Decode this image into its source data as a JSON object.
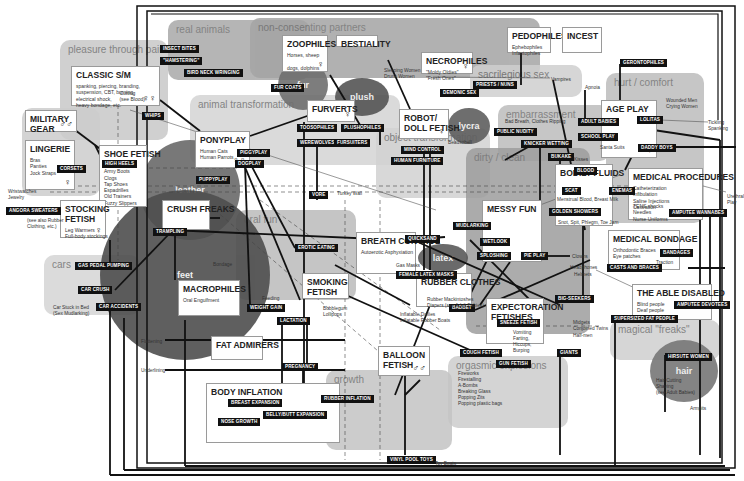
{
  "zones": [
    {
      "id": "real-animals",
      "label": "real animals",
      "x": 168,
      "y": 20,
      "w": 142,
      "h": 60,
      "color": "#a9a9a9"
    },
    {
      "id": "non-consenting",
      "label": "non-consenting partners",
      "x": 250,
      "y": 18,
      "w": 290,
      "h": 60,
      "color": "#a4a4a4"
    },
    {
      "id": "pleasure-pain",
      "label": "pleasure through pain",
      "x": 60,
      "y": 40,
      "w": 108,
      "h": 100,
      "color": "#c8c8c8"
    },
    {
      "id": "sacrilegious",
      "label": "sacrilegious sex",
      "x": 470,
      "y": 65,
      "w": 112,
      "h": 32,
      "color": "#cfcfcf"
    },
    {
      "id": "hurt-comfort",
      "label": "hurt / comfort",
      "x": 606,
      "y": 73,
      "w": 98,
      "h": 150,
      "color": "#bdbdbd"
    },
    {
      "id": "animal-transformation",
      "label": "animal transformation",
      "x": 190,
      "y": 95,
      "w": 210,
      "h": 70,
      "color": "#d4d4d4"
    },
    {
      "id": "embarrassment",
      "label": "embarrassment",
      "x": 498,
      "y": 105,
      "w": 112,
      "h": 56,
      "color": "#bdbdbd"
    },
    {
      "id": "clothing",
      "label": "clothing",
      "x": 22,
      "y": 108,
      "w": 78,
      "h": 88,
      "color": "#cdcdcd"
    },
    {
      "id": "object-transformation",
      "label": "object transformation",
      "x": 376,
      "y": 128,
      "w": 114,
      "h": 70,
      "color": "#d2d2d2"
    },
    {
      "id": "dirty-clean",
      "label": "dirty / clean",
      "x": 466,
      "y": 148,
      "w": 124,
      "h": 186,
      "color": "#9d9d9d"
    },
    {
      "id": "oral-fun",
      "label": "oral fun",
      "x": 236,
      "y": 210,
      "w": 120,
      "h": 90,
      "color": "#bbbbbb"
    },
    {
      "id": "cars",
      "label": "cars",
      "x": 44,
      "y": 255,
      "w": 96,
      "h": 60,
      "color": "#d5d5d5"
    },
    {
      "id": "magical-freaks",
      "label": "magical \"freaks\"",
      "x": 610,
      "y": 320,
      "w": 110,
      "h": 40,
      "color": "#cfcfcf"
    },
    {
      "id": "orgasmic-explosions",
      "label": "orgasmic explosions",
      "x": 448,
      "y": 356,
      "w": 120,
      "h": 72,
      "color": "#cdcdcd"
    },
    {
      "id": "growth",
      "label": "growth",
      "x": 326,
      "y": 370,
      "w": 126,
      "h": 80,
      "color": "#c4c4c4"
    }
  ],
  "blobs": [
    {
      "id": "fur",
      "label": "fur",
      "x": 278,
      "y": 60,
      "w": 50,
      "h": 50,
      "color": "#6f6f6f"
    },
    {
      "id": "plush",
      "label": "plush",
      "x": 335,
      "y": 78,
      "w": 54,
      "h": 38,
      "color": "#555555"
    },
    {
      "id": "lycra",
      "label": "lycra",
      "x": 448,
      "y": 108,
      "w": 42,
      "h": 36,
      "color": "#5f5f5f"
    },
    {
      "id": "leather",
      "label": "leather",
      "x": 140,
      "y": 140,
      "w": 100,
      "h": 100,
      "color": "#6a6a6a"
    },
    {
      "id": "feet",
      "label": "feet",
      "x": 100,
      "y": 190,
      "w": 170,
      "h": 170,
      "color": "#4e4e4e"
    },
    {
      "id": "latex",
      "label": "latex",
      "x": 418,
      "y": 244,
      "w": 50,
      "h": 28,
      "color": "#5a5a5a"
    },
    {
      "id": "hair",
      "label": "hair",
      "x": 650,
      "y": 340,
      "w": 68,
      "h": 62,
      "color": "#777777"
    }
  ],
  "boxes": [
    {
      "id": "classic-sm",
      "title": "CLASSIC S/M",
      "x": 71,
      "y": 66,
      "w": 89,
      "h": 40,
      "sub": "spanking, piercing, branding,\nsuspension, CBT, burning,\nelectrical shock,\nheavy bondage, etc.",
      "note": "Cutting\n(see Blood)",
      "symbol": "♀♀"
    },
    {
      "id": "zoophiles",
      "title": "ZOOPHILES",
      "x": 282,
      "y": 35,
      "w": 46,
      "h": 37,
      "sub": "Horses, sheep\n\ndogs, dolphins",
      "symbol": "♀"
    },
    {
      "id": "bestiality",
      "title": "BESTIALITY",
      "x": 336,
      "y": 35,
      "w": 42,
      "h": 12,
      "sub": ""
    },
    {
      "id": "necrophiles",
      "title": "NECROPHILES",
      "x": 421,
      "y": 52,
      "w": 52,
      "h": 22,
      "sub": "\"Moldy Oldies\"\n\"Fresh Ones\"",
      "symbol": "♀"
    },
    {
      "id": "pedophiles",
      "title": "PEDOPHILES",
      "x": 507,
      "y": 27,
      "w": 44,
      "h": 26,
      "sub": "Ephebophiles\nInfantophiles"
    },
    {
      "id": "incest",
      "title": "INCEST",
      "x": 562,
      "y": 27,
      "w": 40,
      "h": 26,
      "sub": ""
    },
    {
      "id": "military-gear",
      "title": "MILITARY\nGEAR",
      "x": 25,
      "y": 110,
      "w": 52,
      "h": 22,
      "sub": "",
      "symbol": "♂♂"
    },
    {
      "id": "lingerie",
      "title": "LINGERIE",
      "x": 25,
      "y": 140,
      "w": 50,
      "h": 50,
      "sub": "Bras\nPanties\nJock Straps",
      "symbol": "♀"
    },
    {
      "id": "shoe-fetish",
      "title": "SHOE FETISH",
      "x": 99,
      "y": 145,
      "w": 48,
      "h": 62,
      "sub": "Doc Martens\nArmy Boots\nClogs\nTap Shoes\nEspadrilles\nOld Trainers\nFuzzy Slippers"
    },
    {
      "id": "ponyplay",
      "title": "PONYPLAY",
      "x": 195,
      "y": 131,
      "w": 55,
      "h": 37,
      "sub": "Human Cats\nHuman Parrots",
      "symbol": "♀♀"
    },
    {
      "id": "furverts",
      "title": "FURVERTS",
      "x": 307,
      "y": 100,
      "w": 48,
      "h": 22,
      "sub": "",
      "symbol": "♀"
    },
    {
      "id": "robot-doll",
      "title": "ROBOT/\nDOLL FETISH",
      "x": 399,
      "y": 109,
      "w": 50,
      "h": 30,
      "sub": "",
      "symbol": "♀"
    },
    {
      "id": "age-play",
      "title": "AGE PLAY",
      "x": 601,
      "y": 100,
      "w": 56,
      "h": 58,
      "sub": "",
      "symbol": "♀"
    },
    {
      "id": "stocking-fetish",
      "title": "STOCKING\nFETISH",
      "x": 60,
      "y": 200,
      "w": 46,
      "h": 38,
      "sub": "Leg Warmers\nFull-body stockings",
      "symbol": "♀"
    },
    {
      "id": "crush-freaks",
      "title": "CRUSH FREAKS",
      "x": 162,
      "y": 200,
      "w": 48,
      "h": 30,
      "sub": ""
    },
    {
      "id": "bodily-fluids",
      "title": "BODILY FLUIDS",
      "x": 555,
      "y": 164,
      "w": 58,
      "h": 62,
      "sub": "",
      "symbol": ""
    },
    {
      "id": "medical-procedures",
      "title": "MEDICAL PROCEDURES",
      "x": 628,
      "y": 168,
      "w": 75,
      "h": 52,
      "sub": "Catheterization\nInfibulation\nSaline Injections\nCastration",
      "sub2": "TENS shocks\nNeedles\nNurse Uniforms"
    },
    {
      "id": "messy-fun",
      "title": "MESSY FUN",
      "x": 482,
      "y": 200,
      "w": 60,
      "h": 62,
      "sub": ""
    },
    {
      "id": "breath-control",
      "title": "BREATH CONTROL",
      "x": 356,
      "y": 232,
      "w": 60,
      "h": 42,
      "sub": "Autoerotic Asphyxiation"
    },
    {
      "id": "medical-bondage",
      "title": "MEDICAL BONDAGE",
      "x": 608,
      "y": 230,
      "w": 72,
      "h": 40,
      "sub": "Orthodontic Braces\nEye patches"
    },
    {
      "id": "rubber-clothes",
      "title": "RUBBER CLOTHES",
      "x": 416,
      "y": 273,
      "w": 56,
      "h": 34,
      "sub": ""
    },
    {
      "id": "smoking-fetish",
      "title": "SMOKING\nFETISH",
      "x": 302,
      "y": 273,
      "w": 47,
      "h": 26,
      "sub": ""
    },
    {
      "id": "macrophiles",
      "title": "MACROPHILES",
      "x": 178,
      "y": 280,
      "w": 62,
      "h": 36,
      "sub": "Oral Engulfment"
    },
    {
      "id": "able-disabled",
      "title": "THE ABLE DISABLED",
      "x": 632,
      "y": 284,
      "w": 80,
      "h": 36,
      "sub": "Blind people\nDeaf people\nParaplegics"
    },
    {
      "id": "expectoration",
      "title": "EXPECTORATION\nFETISHES",
      "x": 486,
      "y": 298,
      "w": 58,
      "h": 46,
      "sub": ""
    },
    {
      "id": "fat-admirers",
      "title": "FAT ADMIRERS",
      "x": 211,
      "y": 336,
      "w": 52,
      "h": 24,
      "sub": ""
    },
    {
      "id": "balloon-fetish",
      "title": "BALLOON\nFETISH",
      "x": 378,
      "y": 346,
      "w": 52,
      "h": 30,
      "sub": "",
      "symbol": "♂♂"
    },
    {
      "id": "body-inflation",
      "title": "BODY INFLATION",
      "x": 206,
      "y": 383,
      "w": 134,
      "h": 60,
      "sub": ""
    }
  ],
  "tags": [
    {
      "label": "INSECT BITES",
      "x": 160,
      "y": 45
    },
    {
      "label": "\"HAMSTERING\"",
      "x": 160,
      "y": 57
    },
    {
      "label": "BIRD NECK WRINGING",
      "x": 184,
      "y": 69
    },
    {
      "label": "FUR COATS",
      "x": 271,
      "y": 84
    },
    {
      "label": "WHIPS",
      "x": 142,
      "y": 112
    },
    {
      "label": "PRIESTS / NUNS",
      "x": 473,
      "y": 81
    },
    {
      "label": "DEMONIC SEX",
      "x": 440,
      "y": 89
    },
    {
      "label": "GERONTOPHILES",
      "x": 620,
      "y": 59
    },
    {
      "label": "ADULT BABIES",
      "x": 578,
      "y": 118
    },
    {
      "label": "LOLITAS",
      "x": 637,
      "y": 116
    },
    {
      "label": "SCHOOL PLAY",
      "x": 578,
      "y": 133
    },
    {
      "label": "DADDY BOYS",
      "x": 638,
      "y": 144
    },
    {
      "label": "PUBLIC NUDITY",
      "x": 494,
      "y": 128
    },
    {
      "label": "KNICKER WETTING",
      "x": 521,
      "y": 140
    },
    {
      "label": "BUKAKE",
      "x": 548,
      "y": 153
    },
    {
      "label": "BLOOD",
      "x": 574,
      "y": 167
    },
    {
      "label": "SCAT",
      "x": 562,
      "y": 187
    },
    {
      "label": "ENEMAS",
      "x": 609,
      "y": 187
    },
    {
      "label": "GOLDEN SHOWERS",
      "x": 549,
      "y": 208
    },
    {
      "label": "AMPUTEE WANNABES",
      "x": 669,
      "y": 209
    },
    {
      "label": "TOOSOPHILES",
      "x": 297,
      "y": 124
    },
    {
      "label": "PLUSHOPHILES",
      "x": 341,
      "y": 124
    },
    {
      "label": "WEREWOLVES",
      "x": 297,
      "y": 139
    },
    {
      "label": "FURSUITERS",
      "x": 334,
      "y": 139
    },
    {
      "label": "MIND CONTROL",
      "x": 401,
      "y": 146
    },
    {
      "label": "HUMAN FURNITURE",
      "x": 391,
      "y": 157
    },
    {
      "label": "HIGH HEELS",
      "x": 102,
      "y": 160
    },
    {
      "label": "PIGGYPLAY",
      "x": 237,
      "y": 149
    },
    {
      "label": "DOGPLAY",
      "x": 235,
      "y": 160
    },
    {
      "label": "PUPPYPLAY",
      "x": 196,
      "y": 176
    },
    {
      "label": "CORSETS",
      "x": 57,
      "y": 165
    },
    {
      "label": "ANGORA SWEATERS",
      "x": 6,
      "y": 207
    },
    {
      "label": "VORE",
      "x": 309,
      "y": 191
    },
    {
      "label": "MUDLARKING",
      "x": 453,
      "y": 222
    },
    {
      "label": "QUICKSAND",
      "x": 405,
      "y": 235
    },
    {
      "label": "WETLOOK",
      "x": 480,
      "y": 238
    },
    {
      "label": "SPLOSHING",
      "x": 477,
      "y": 252
    },
    {
      "label": "PIE PLAY",
      "x": 521,
      "y": 252
    },
    {
      "label": "BANDAGES",
      "x": 660,
      "y": 249
    },
    {
      "label": "CASTS AND BRACES",
      "x": 607,
      "y": 264
    },
    {
      "label": "TRAMPLING",
      "x": 153,
      "y": 228
    },
    {
      "label": "EROTIC EATING",
      "x": 295,
      "y": 244
    },
    {
      "label": "FEMALE LATEX MASKS",
      "x": 396,
      "y": 271
    },
    {
      "label": "GAS PEDAL PUMPING",
      "x": 75,
      "y": 262
    },
    {
      "label": "CAR CRUSH",
      "x": 78,
      "y": 286
    },
    {
      "label": "CAR ACCIDENTS",
      "x": 96,
      "y": 303
    },
    {
      "label": "WEIGHT GAIN",
      "x": 247,
      "y": 304
    },
    {
      "label": "LACTATION",
      "x": 277,
      "y": 317
    },
    {
      "label": "BIG-SEEKERS",
      "x": 555,
      "y": 295
    },
    {
      "label": "BADBET",
      "x": 449,
      "y": 304
    },
    {
      "label": "AMPUTEE DEVOTEES",
      "x": 674,
      "y": 301
    },
    {
      "label": "SUPERSIZED FAT PEOPLE",
      "x": 611,
      "y": 315
    },
    {
      "label": "SNEEZE FETISH",
      "x": 497,
      "y": 319
    },
    {
      "label": "COUGH FETISH",
      "x": 460,
      "y": 349
    },
    {
      "label": "GIANTS",
      "x": 557,
      "y": 349
    },
    {
      "label": "GUN FETISH",
      "x": 496,
      "y": 360
    },
    {
      "label": "PREGNANCY",
      "x": 282,
      "y": 363
    },
    {
      "label": "RUBBER INFLATION",
      "x": 321,
      "y": 395
    },
    {
      "label": "BREAST EXPANSION",
      "x": 228,
      "y": 399
    },
    {
      "label": "BELLY/BUTT EXPANSION",
      "x": 263,
      "y": 411
    },
    {
      "label": "NOSE GROWTH",
      "x": 218,
      "y": 418
    },
    {
      "label": "HIRSUTE WOMEN",
      "x": 665,
      "y": 353
    },
    {
      "label": "VINYL POOL TOYS",
      "x": 387,
      "y": 456
    }
  ],
  "notes": [
    {
      "text": "Sleeping Women\nDrunk Women",
      "x": 384,
      "y": 68
    },
    {
      "text": "Vampires",
      "x": 551,
      "y": 77
    },
    {
      "text": "Apnoia",
      "x": 585,
      "y": 85
    },
    {
      "text": "Wounded Men\nCrying Women",
      "x": 666,
      "y": 98
    },
    {
      "text": "Tickling\nSpanking",
      "x": 708,
      "y": 120
    },
    {
      "text": "Bad Breath, Clothes Ripping",
      "x": 505,
      "y": 119
    },
    {
      "text": "Santa Suits",
      "x": 600,
      "y": 145
    },
    {
      "text": "Kisses",
      "x": 574,
      "y": 157
    },
    {
      "text": "Menstrual Blood, Breast Milk",
      "x": 557,
      "y": 197
    },
    {
      "text": "Snot, Spit, Phlegm, Toe Jam",
      "x": 558,
      "y": 220
    },
    {
      "text": "Urethral\nPlay",
      "x": 727,
      "y": 194
    },
    {
      "text": "Beadsobell",
      "x": 448,
      "y": 140
    },
    {
      "text": "Wristwatches\nJewelry",
      "x": 8,
      "y": 189
    },
    {
      "text": "(see also Rubber\nClothing, etc.)",
      "x": 27,
      "y": 218
    },
    {
      "text": "Turkey Wall",
      "x": 337,
      "y": 191
    },
    {
      "text": "Bondage",
      "x": 213,
      "y": 262
    },
    {
      "text": "Gas Masks",
      "x": 396,
      "y": 263
    },
    {
      "text": "Clowns",
      "x": 572,
      "y": 254
    },
    {
      "text": "Headphones",
      "x": 570,
      "y": 265
    },
    {
      "text": "Helmets",
      "x": 574,
      "y": 272
    },
    {
      "text": "Traction",
      "x": 656,
      "y": 260
    },
    {
      "text": "Feeding",
      "x": 262,
      "y": 296
    },
    {
      "text": "Bubblegum\nLollipops",
      "x": 323,
      "y": 306
    },
    {
      "text": "Rubber Mackintoshes\nDiapers (see Adult Babies)",
      "x": 427,
      "y": 297
    },
    {
      "text": "Inflatable Dollies\nInflatable Rubber Boats",
      "x": 400,
      "y": 312
    },
    {
      "text": "Car Stuck in Bed\n(Sex Mudlarking)",
      "x": 53,
      "y": 305
    },
    {
      "text": "Vomiting\nFarting,\nHiccups,\nBurping",
      "x": 513,
      "y": 330
    },
    {
      "text": "Midgets\nConjoined Twins",
      "x": 573,
      "y": 320
    },
    {
      "text": "Half-men",
      "x": 573,
      "y": 333
    },
    {
      "text": "Flattening",
      "x": 141,
      "y": 339
    },
    {
      "text": "Underlining",
      "x": 141,
      "y": 368
    },
    {
      "text": "Fireworks\nFirestalling\nA-Bombs\nBreaking Glass\nPopping Zits\nPopping plastic bags",
      "x": 458,
      "y": 371
    },
    {
      "text": "Hair Cutting\nShaving\n(see Adult Babies)",
      "x": 656,
      "y": 378
    },
    {
      "text": "Armpits",
      "x": 690,
      "y": 406
    },
    {
      "text": "Toy Boats",
      "x": 435,
      "y": 461
    }
  ],
  "legend": {
    "female_symbol": "♀",
    "male_symbol": "♂"
  },
  "colors": {
    "line": "#111111",
    "tag_bg": "#111111",
    "tag_fg": "#ffffff",
    "box_bg": "#ffffff"
  }
}
